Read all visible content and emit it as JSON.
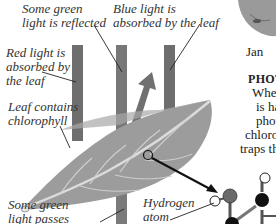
{
  "diagram": {
    "labels": {
      "green_reflected": [
        "Some green",
        "light is reflected"
      ],
      "blue_absorbed": [
        "Blue light is",
        "absorbed by the leaf"
      ],
      "red_absorbed": [
        "Red light is",
        "absorbed by",
        "the leaf"
      ],
      "chlorophyll": [
        "Leaf contains",
        "chlorophyll"
      ],
      "green_passes": [
        "Some green",
        "light passes"
      ],
      "hydrogen": [
        "Hydrogen",
        "atom"
      ]
    },
    "colors": {
      "light_bar": "#6e6e6e",
      "leaf": "#9a9a9a",
      "leaf_vein": "#d8d8d8",
      "carbon_atom": "#111111",
      "oxygen_atom": "#6a6a6a",
      "hydrogen_atom": "#ffffff"
    }
  },
  "sidebar_text": {
    "caption": "Jan",
    "heading": "PHOTO",
    "body_lines": [
      "When",
      "is ha",
      "photo",
      "chloro",
      "traps th"
    ]
  }
}
